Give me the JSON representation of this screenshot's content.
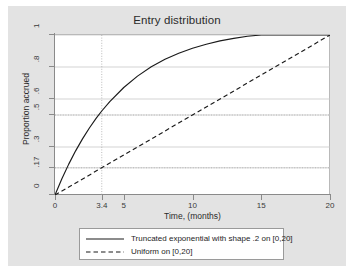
{
  "chart_data": {
    "type": "line",
    "title": "Entry distribution",
    "xlabel": "Time, (months)",
    "ylabel": "Proportion accrued",
    "xlim": [
      0,
      20
    ],
    "ylim": [
      0,
      1
    ],
    "grid": true,
    "grid_style": "horizontal-dotted",
    "legend_position": "bottom-outside",
    "xticks": [
      {
        "value": 0,
        "label": "0"
      },
      {
        "value": 3.4,
        "label": "3.4"
      },
      {
        "value": 5,
        "label": "5"
      },
      {
        "value": 10,
        "label": "10"
      },
      {
        "value": 15,
        "label": "15"
      },
      {
        "value": 20,
        "label": "20"
      }
    ],
    "yticks": [
      {
        "value": 0,
        "label": "0"
      },
      {
        "value": 0.17,
        "label": ".17"
      },
      {
        "value": 0.3,
        "label": ".3"
      },
      {
        "value": 0.5,
        "label": ".5"
      },
      {
        "value": 0.6,
        "label": ".6"
      },
      {
        "value": 0.8,
        "label": ".8"
      },
      {
        "value": 1,
        "label": "1"
      }
    ],
    "reference_lines": [
      {
        "orientation": "vertical",
        "value": 3.4,
        "style": "dotted"
      },
      {
        "orientation": "horizontal",
        "value": 0.17,
        "style": "dotted"
      },
      {
        "orientation": "horizontal",
        "value": 0.5,
        "style": "dotted"
      }
    ],
    "series": [
      {
        "name": "Truncated exponential with shape .2 on [0,20]",
        "style": "solid",
        "color": "#1a1a1a",
        "x": [
          0,
          0.5,
          1,
          1.5,
          2,
          2.5,
          3,
          3.4,
          4,
          5,
          6,
          7,
          8,
          9,
          10,
          11,
          12,
          13,
          14,
          15,
          16,
          17,
          18,
          19,
          20
        ],
        "y": [
          0,
          0.101,
          0.193,
          0.276,
          0.351,
          0.419,
          0.48,
          0.525,
          0.585,
          0.672,
          0.743,
          0.801,
          0.848,
          0.886,
          0.917,
          0.942,
          0.963,
          0.979,
          0.992,
          1.0,
          1.0,
          1.0,
          1.0,
          1.0,
          1.0
        ]
      },
      {
        "name": "Uniform on [0,20]",
        "style": "dashed",
        "color": "#1a1a1a",
        "x": [
          0,
          20
        ],
        "y": [
          0,
          1
        ]
      }
    ],
    "annotations": [
      {
        "text": "curve reaches .5 at t = 3.4",
        "x": 3.4,
        "y": 0.5
      },
      {
        "text": "uniform reaches .17 at t = 3.4",
        "x": 3.4,
        "y": 0.17
      }
    ]
  },
  "legend": {
    "entries": [
      {
        "label": "Truncated exponential with shape .2 on [0,20]",
        "style": "solid"
      },
      {
        "label": "Uniform on [0,20]",
        "style": "dashed"
      }
    ]
  },
  "colors": {
    "panel_background": "#e3e3e3",
    "plot_background": "#ffffff",
    "axis": "#8a8a8a",
    "grid": "#c8c8c8",
    "line": "#1a1a1a",
    "text": "#2b2b2b"
  }
}
